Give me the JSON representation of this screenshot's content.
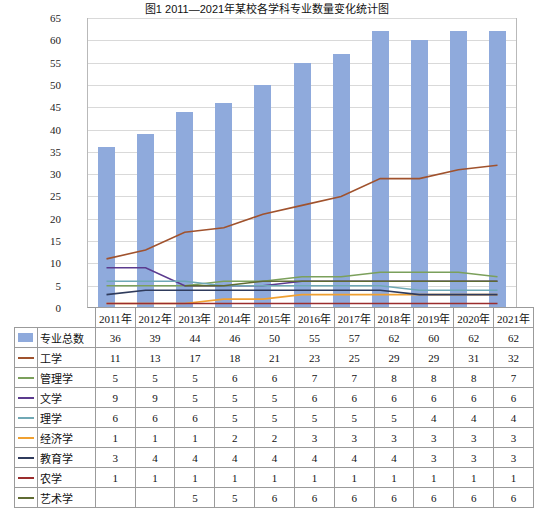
{
  "chart_data": {
    "type": "bar",
    "title": "图1 2011—2021年某校各学科专业数量变化统计图",
    "categories": [
      "2011年",
      "2012年",
      "2013年",
      "2014年",
      "2015年",
      "2016年",
      "2017年",
      "2018年",
      "2019年",
      "2020年",
      "2021年"
    ],
    "ylim": [
      0,
      65
    ],
    "yticks": [
      0,
      5,
      10,
      15,
      20,
      25,
      30,
      35,
      40,
      45,
      50,
      55,
      60,
      65
    ],
    "grid": true,
    "xlabel": "",
    "ylabel": "",
    "legend_position": "table-below",
    "series": [
      {
        "name": "专业总数",
        "type": "bar",
        "color": "#8faadc",
        "values": [
          36,
          39,
          44,
          46,
          50,
          55,
          57,
          62,
          60,
          62,
          62
        ]
      },
      {
        "name": "工学",
        "type": "line",
        "color": "#a0522d",
        "values": [
          11,
          13,
          17,
          18,
          21,
          23,
          25,
          29,
          29,
          31,
          32
        ]
      },
      {
        "name": "管理学",
        "type": "line",
        "color": "#7ba05b",
        "values": [
          5,
          5,
          5,
          6,
          6,
          7,
          7,
          8,
          8,
          8,
          7
        ]
      },
      {
        "name": "文学",
        "type": "line",
        "color": "#5b3a8e",
        "values": [
          9,
          9,
          5,
          5,
          5,
          6,
          6,
          6,
          6,
          6,
          6
        ]
      },
      {
        "name": "理学",
        "type": "line",
        "color": "#6fa8b5",
        "values": [
          6,
          6,
          6,
          5,
          5,
          5,
          5,
          5,
          4,
          4,
          4
        ]
      },
      {
        "name": "经济学",
        "type": "line",
        "color": "#f0a030",
        "values": [
          1,
          1,
          1,
          2,
          2,
          3,
          3,
          3,
          3,
          3,
          3
        ]
      },
      {
        "name": "教育学",
        "type": "line",
        "color": "#2f3b5c",
        "values": [
          3,
          4,
          4,
          4,
          4,
          4,
          4,
          4,
          3,
          3,
          3
        ]
      },
      {
        "name": "农学",
        "type": "line",
        "color": "#9b2d2d",
        "values": [
          1,
          1,
          1,
          1,
          1,
          1,
          1,
          1,
          1,
          1,
          1
        ]
      },
      {
        "name": "艺术学",
        "type": "line",
        "color": "#5f6b32",
        "values": [
          null,
          null,
          5,
          5,
          6,
          6,
          6,
          6,
          6,
          6,
          6
        ]
      }
    ]
  },
  "table": {
    "header": [
      "",
      "",
      "2011年",
      "2012年",
      "2013年",
      "2014年",
      "2015年",
      "2016年",
      "2017年",
      "2018年",
      "2019年",
      "2020年",
      "2021年"
    ],
    "rows": [
      {
        "key": "box",
        "color": "#8faadc",
        "name": "专业总数",
        "values": [
          "36",
          "39",
          "44",
          "46",
          "50",
          "55",
          "57",
          "62",
          "60",
          "62",
          "62"
        ]
      },
      {
        "key": "line",
        "color": "#a0522d",
        "name": "工学",
        "values": [
          "11",
          "13",
          "17",
          "18",
          "21",
          "23",
          "25",
          "29",
          "29",
          "31",
          "32"
        ]
      },
      {
        "key": "line",
        "color": "#7ba05b",
        "name": "管理学",
        "values": [
          "5",
          "5",
          "5",
          "6",
          "6",
          "7",
          "7",
          "8",
          "8",
          "8",
          "7"
        ]
      },
      {
        "key": "line",
        "color": "#5b3a8e",
        "name": "文学",
        "values": [
          "9",
          "9",
          "5",
          "5",
          "5",
          "6",
          "6",
          "6",
          "6",
          "6",
          "6"
        ]
      },
      {
        "key": "line",
        "color": "#6fa8b5",
        "name": "理学",
        "values": [
          "6",
          "6",
          "6",
          "5",
          "5",
          "5",
          "5",
          "5",
          "4",
          "4",
          "4"
        ]
      },
      {
        "key": "line",
        "color": "#f0a030",
        "name": "经济学",
        "values": [
          "1",
          "1",
          "1",
          "2",
          "2",
          "3",
          "3",
          "3",
          "3",
          "3",
          "3"
        ]
      },
      {
        "key": "line",
        "color": "#2f3b5c",
        "name": "教育学",
        "values": [
          "3",
          "4",
          "4",
          "4",
          "4",
          "4",
          "4",
          "4",
          "3",
          "3",
          "3"
        ]
      },
      {
        "key": "line",
        "color": "#9b2d2d",
        "name": "农学",
        "values": [
          "1",
          "1",
          "1",
          "1",
          "1",
          "1",
          "1",
          "1",
          "1",
          "1",
          "1"
        ]
      },
      {
        "key": "line",
        "color": "#5f6b32",
        "name": "艺术学",
        "values": [
          "",
          "",
          "5",
          "5",
          "6",
          "6",
          "6",
          "6",
          "6",
          "6",
          "6"
        ]
      }
    ]
  }
}
